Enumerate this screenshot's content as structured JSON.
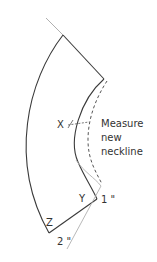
{
  "diagram": {
    "type": "sewing-pattern-collar",
    "labels": {
      "x_point": "X",
      "y_point": "Y",
      "z_point": "Z",
      "annotation_line1": "Measure",
      "annotation_line2": "new",
      "annotation_line3": "neckline",
      "one_inch": "1 \"",
      "two_inch": "2 \""
    },
    "colors": {
      "outline": "#3a3a3a",
      "guide": "#b0b0b0",
      "dashed": "#555555",
      "text": "#333333",
      "background": "#ffffff"
    }
  }
}
